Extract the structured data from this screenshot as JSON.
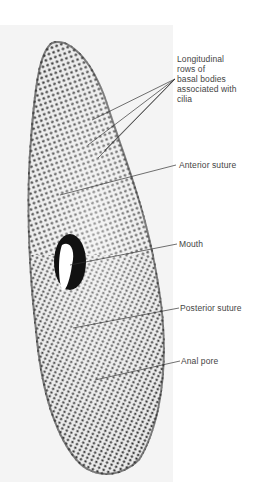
{
  "figure": {
    "labels": [
      {
        "id": "basal-bodies",
        "text": "Longitudinal\nrows of\nbasal bodies\nassociated with\ncilia"
      },
      {
        "id": "anterior-suture",
        "text": "Anterior suture"
      },
      {
        "id": "mouth",
        "text": "Mouth"
      },
      {
        "id": "posterior-suture",
        "text": "Posterior suture"
      },
      {
        "id": "anal-pore",
        "text": "Anal pore"
      }
    ]
  }
}
